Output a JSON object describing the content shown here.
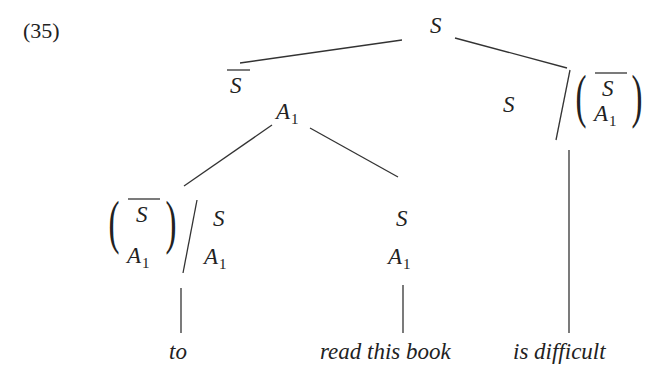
{
  "example_number": "(35)",
  "tree": {
    "root": {
      "label": "S"
    },
    "left_subtree": {
      "category_top": "S",
      "category_top_overline": true,
      "category_bottom": "A",
      "category_bottom_subscript": "1",
      "children": [
        {
          "functor_numerator_top": "S",
          "functor_numerator_top_overline": true,
          "functor_numerator_bottom": "A",
          "functor_numerator_bottom_subscript": "1",
          "slash": "/",
          "functor_argument_top": "S",
          "functor_argument_bottom": "A",
          "functor_argument_bottom_subscript": "1",
          "word": "to"
        },
        {
          "category_top": "S",
          "category_bottom": "A",
          "category_bottom_subscript": "1",
          "word": "read this book"
        }
      ]
    },
    "right_subtree": {
      "result": "S",
      "slash": "/",
      "argument_top": "S",
      "argument_top_overline": true,
      "argument_bottom": "A",
      "argument_bottom_subscript": "1",
      "word": "is difficult"
    }
  },
  "colors": {
    "ink": "#222222",
    "background": "#ffffff"
  }
}
